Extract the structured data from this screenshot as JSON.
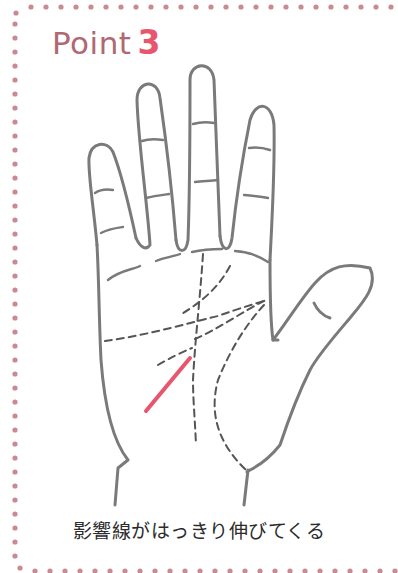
{
  "title": {
    "word": "Point",
    "number": "3"
  },
  "caption": "影響線がはっきり伸びてくる",
  "colors": {
    "border_dots": "#c98a93",
    "title_word": "#b06872",
    "title_number": "#e8566d",
    "hand_outline": "#7a7a7a",
    "palm_lines": "#555555",
    "highlight_line": "#e8566d",
    "caption_text": "#2b2b2b"
  },
  "illustration": {
    "subject": "right palm with palmistry lines",
    "highlighted_line": "influence line (影響線)"
  }
}
